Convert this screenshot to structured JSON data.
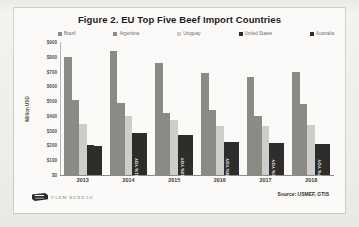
{
  "figure": {
    "title": "Figure 2. EU Top Five Beef Import Countries",
    "source": "Source: USMEF, GTIS",
    "brand": "FARM BUREAU"
  },
  "chart_data": {
    "type": "bar",
    "title": "Figure 2. EU Top Five Beef Import Countries",
    "xlabel": "",
    "ylabel": "Million USD",
    "ylim": [
      0,
      900
    ],
    "yticks": [
      "$0",
      "$100",
      "$200",
      "$300",
      "$400",
      "$500",
      "$600",
      "$700",
      "$800",
      "$900"
    ],
    "ytick_values": [
      0,
      100,
      200,
      300,
      400,
      500,
      600,
      700,
      800,
      900
    ],
    "grid": false,
    "legend_position": "top",
    "categories": [
      "2013",
      "2014",
      "2015",
      "2016",
      "2017",
      "2018"
    ],
    "series": [
      {
        "name": "Brazil",
        "color": "#8c8a86",
        "values": [
          800,
          840,
          760,
          690,
          660,
          700
        ]
      },
      {
        "name": "Argentina",
        "color": "#8c8a86",
        "values": [
          510,
          490,
          420,
          440,
          400,
          480
        ]
      },
      {
        "name": "Uruguay",
        "color": "#cfcdc9",
        "values": [
          345,
          400,
          370,
          330,
          330,
          340
        ]
      },
      {
        "name": "United States",
        "color": "#2e2d2b",
        "values": [
          205,
          285,
          270,
          225,
          220,
          210
        ]
      },
      {
        "name": "Australia",
        "color": "#2e2d2b",
        "values": [
          195,
          285,
          270,
          225,
          220,
          210
        ]
      }
    ],
    "annotations": [
      {
        "category": "2013",
        "text": ""
      },
      {
        "category": "2014",
        "text": "+11% YOY"
      },
      {
        "category": "2015",
        "text": "+13% YOY"
      },
      {
        "category": "2016",
        "text": "-23% YOY"
      },
      {
        "category": "2017",
        "text": "-1% YOY"
      },
      {
        "category": "2018",
        "text": "-7% YOY"
      }
    ]
  }
}
